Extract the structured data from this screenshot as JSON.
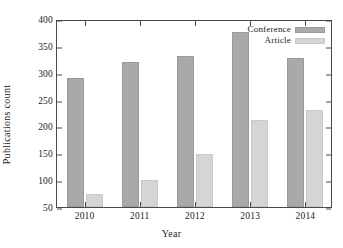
{
  "chart_data": {
    "type": "bar",
    "title": "",
    "xlabel": "Year",
    "ylabel": "Publications count",
    "categories": [
      "2010",
      "2011",
      "2012",
      "2013",
      "2014"
    ],
    "series": [
      {
        "name": "Conference",
        "color": "#a9a9a9",
        "values": [
          291,
          320,
          331,
          375,
          328
        ]
      },
      {
        "name": "Article",
        "color": "#d5d5d5",
        "values": [
          74,
          100,
          148,
          212,
          230
        ]
      }
    ],
    "ylim": [
      50,
      400
    ],
    "yticks": [
      50,
      100,
      150,
      200,
      250,
      300,
      350,
      400
    ],
    "ytick_labels": [
      "50",
      "100",
      "150",
      "200",
      "250",
      "300",
      "350",
      "400"
    ],
    "grid": false,
    "legend_position": "top-right"
  }
}
